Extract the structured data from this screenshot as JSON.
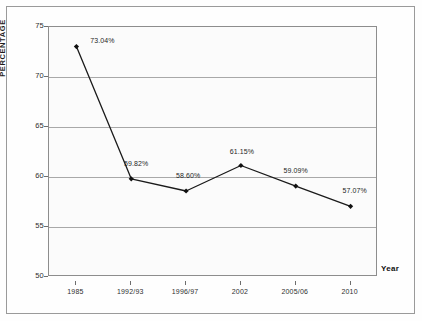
{
  "chart_data": {
    "type": "line",
    "title": "",
    "subtitle": "",
    "xlabel": "Year",
    "ylabel": "PERCENTAGE",
    "categories": [
      "1985",
      "1992/93",
      "1996/97",
      "2002",
      "2005/06",
      "2010"
    ],
    "values": [
      73.04,
      59.82,
      58.6,
      61.15,
      59.09,
      57.07
    ],
    "point_labels": [
      "73.04%",
      "59.82%",
      "58.60%",
      "61.15%",
      "59.09%",
      "57.07%"
    ],
    "series": [
      {
        "name": "Percentage",
        "values": [
          73.04,
          59.82,
          58.6,
          61.15,
          59.09,
          57.07
        ]
      }
    ],
    "ylim": [
      50,
      75
    ],
    "yticks": [
      50,
      55,
      60,
      65,
      70,
      75
    ],
    "ytick_labels": [
      "50",
      "55",
      "60",
      "65",
      "70",
      "75"
    ],
    "grid": true,
    "grid_axis": "y",
    "legend": false,
    "legend_position": "none",
    "marker": "diamond",
    "line_color": "#1a1a1a",
    "marker_color": "#111111",
    "grid_color": "#a8a8a8",
    "plot_background": "#fbfbfb",
    "annotations": []
  },
  "figure": {
    "y_axis_title": "PERCENTAGE",
    "x_axis_title": "Year"
  }
}
